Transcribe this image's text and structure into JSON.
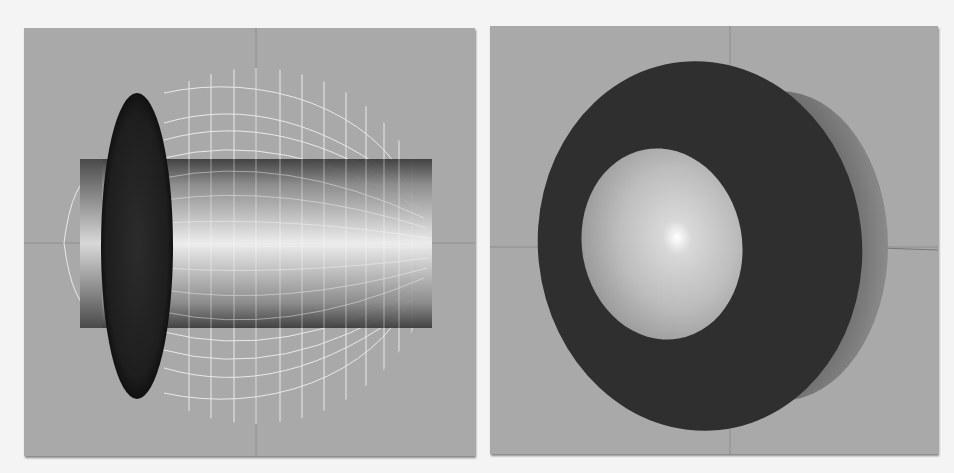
{
  "viewports": [
    {
      "id": "left",
      "view": "side",
      "background": "#a9a9a9",
      "objects": [
        "wireframe-sphere",
        "shaded-cylinder",
        "dark-disc-ellipsoid"
      ]
    },
    {
      "id": "right",
      "view": "perspective",
      "background": "#a9a9a9",
      "objects": [
        "dark-disc",
        "shaded-sphere",
        "back-hemisphere-rim"
      ]
    }
  ],
  "colors": {
    "page_bg": "#f4f4f4",
    "viewport_bg": "#a9a9a9",
    "axis_line": "#8c8c8c",
    "disc_dark": "#2e2e2e",
    "wireframe": "#f2f2f2"
  }
}
